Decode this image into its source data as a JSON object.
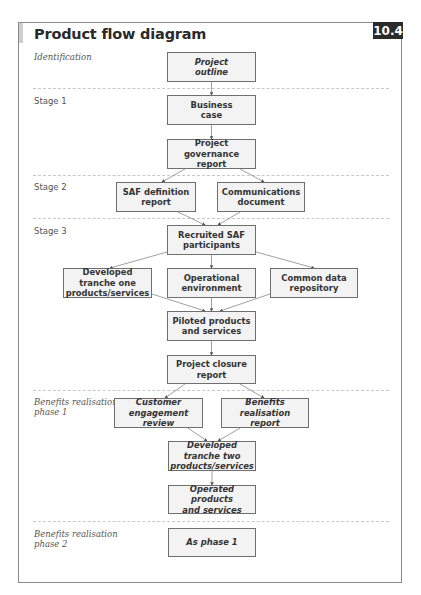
{
  "header": {
    "title": "Product flow diagram",
    "badge": "10.4"
  },
  "stages": [
    {
      "label": "Identification",
      "italic": true
    },
    {
      "label": "Stage 1",
      "italic": false
    },
    {
      "label": "Stage 2",
      "italic": false
    },
    {
      "label": "Stage 3",
      "italic": false
    },
    {
      "label": "Benefits realisation phase 1",
      "line1": "Benefits realisation",
      "line2": "phase 1",
      "italic": true
    },
    {
      "label": "Benefits realisation phase 2",
      "line1": "Benefits realisation",
      "line2": "phase 2",
      "italic": true
    }
  ],
  "nodes": {
    "project_outline": {
      "line1": "Project",
      "line2": "outline",
      "italic": true
    },
    "business_case": {
      "line1": "Business",
      "line2": "case"
    },
    "project_governance_report": {
      "line1": "Project governance",
      "line2": "report"
    },
    "saf_definition_report": {
      "line1": "SAF definition",
      "line2": "report"
    },
    "communications_document": {
      "line1": "Communications",
      "line2": "document"
    },
    "recruited_saf_participants": {
      "line1": "Recruited SAF",
      "line2": "participants"
    },
    "developed_tranche_one": {
      "line1": "Developed tranche one",
      "line2": "products/services"
    },
    "operational_environment": {
      "line1": "Operational",
      "line2": "environment"
    },
    "common_data_repository": {
      "line1": "Common data",
      "line2": "repository"
    },
    "piloted_products": {
      "line1": "Piloted products",
      "line2": "and services"
    },
    "project_closure_report": {
      "line1": "Project closure",
      "line2": "report"
    },
    "customer_engagement_review": {
      "line1": "Customer engagement",
      "line2": "review",
      "italic": true
    },
    "benefits_realisation_report": {
      "line1": "Benefits realisation",
      "line2": "report",
      "italic": true
    },
    "developed_tranche_two": {
      "line1": "Developed tranche two",
      "line2": "products/services",
      "italic": true
    },
    "operated_products": {
      "line1": "Operated products",
      "line2": "and services",
      "italic": true
    },
    "as_phase_1": {
      "line1": "As phase 1",
      "italic": true
    }
  },
  "edges": [
    [
      "project_outline",
      "business_case"
    ],
    [
      "business_case",
      "project_governance_report"
    ],
    [
      "project_governance_report",
      "saf_definition_report"
    ],
    [
      "project_governance_report",
      "communications_document"
    ],
    [
      "saf_definition_report",
      "recruited_saf_participants"
    ],
    [
      "communications_document",
      "recruited_saf_participants"
    ],
    [
      "recruited_saf_participants",
      "developed_tranche_one"
    ],
    [
      "recruited_saf_participants",
      "operational_environment"
    ],
    [
      "recruited_saf_participants",
      "common_data_repository"
    ],
    [
      "developed_tranche_one",
      "piloted_products"
    ],
    [
      "operational_environment",
      "piloted_products"
    ],
    [
      "common_data_repository",
      "piloted_products"
    ],
    [
      "piloted_products",
      "project_closure_report"
    ],
    [
      "project_closure_report",
      "customer_engagement_review"
    ],
    [
      "project_closure_report",
      "benefits_realisation_report"
    ],
    [
      "customer_engagement_review",
      "developed_tranche_two"
    ],
    [
      "benefits_realisation_report",
      "developed_tranche_two"
    ],
    [
      "developed_tranche_two",
      "operated_products"
    ]
  ]
}
